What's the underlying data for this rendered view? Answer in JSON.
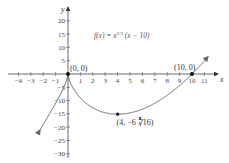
{
  "chart_data": {
    "type": "line",
    "title_parts": {
      "f": "f(x) = x",
      "exp": "2/3",
      "rest": " (x − 10)"
    },
    "xlabel": "x",
    "ylabel": "y",
    "xlim": [
      -4,
      11
    ],
    "ylim": [
      -30,
      20
    ],
    "x_ticks": [
      "-4",
      "-3",
      "-2",
      "-1",
      "1",
      "2",
      "3",
      "4",
      "5",
      "6",
      "7",
      "8",
      "9",
      "10",
      "11"
    ],
    "x_tick_values": [
      -4,
      -3,
      -2,
      -1,
      1,
      2,
      3,
      4,
      5,
      6,
      7,
      8,
      9,
      10,
      11
    ],
    "y_ticks": [
      "20",
      "15",
      "10",
      "5",
      "-5",
      "-10",
      "-15",
      "-20",
      "-25",
      "-30"
    ],
    "y_tick_values": [
      20,
      15,
      10,
      5,
      -5,
      -10,
      -15,
      -20,
      -25,
      -30
    ],
    "grid": false,
    "series": [
      {
        "name": "f(x) = x^(2/3)(x − 10)",
        "function": "x^(2/3)*(x-10)",
        "x_range": [
          -2.25,
          11.3
        ],
        "arrows": "both",
        "color": "#555555"
      }
    ],
    "annotations": [
      {
        "label": "(0, 0)",
        "x": 0,
        "y": 0
      },
      {
        "label": "(10, 0)",
        "x": 10,
        "y": 0
      },
      {
        "label": "(4, −6∛16)",
        "label_main": "(4, −6",
        "label_root": "∛16",
        "label_close": ")",
        "x": 4,
        "y": -15.12
      }
    ]
  },
  "colors": {
    "axis": "#444444",
    "curve": "#666666",
    "point": "#111111"
  }
}
